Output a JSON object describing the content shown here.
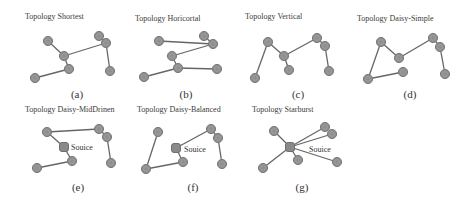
{
  "figure": {
    "node_color": "#8e8e8e",
    "edge_color": "#666666",
    "panels": [
      {
        "id": "a",
        "caption": "(a)",
        "title": "Topology Shortest",
        "title_pos": [
          25,
          19
        ],
        "caption_pos": [
          77,
          98
        ],
        "nodes": [
          [
            48,
            41
          ],
          [
            64,
            56
          ],
          [
            69,
            69
          ],
          [
            35,
            78
          ],
          [
            99,
            36
          ],
          [
            106,
            43
          ],
          [
            110,
            71
          ]
        ],
        "edges": [
          [
            0,
            1
          ],
          [
            1,
            2
          ],
          [
            2,
            3
          ],
          [
            1,
            5
          ],
          [
            4,
            5
          ],
          [
            5,
            6
          ]
        ],
        "source": null
      },
      {
        "id": "b",
        "caption": "(b)",
        "title": "Topology Horicortal",
        "title_pos": [
          135,
          21
        ],
        "caption_pos": [
          186,
          98
        ],
        "nodes": [
          [
            159,
            41
          ],
          [
            204,
            36
          ],
          [
            213,
            44
          ],
          [
            172,
            56
          ],
          [
            178,
            68
          ],
          [
            217,
            69
          ],
          [
            144,
            77
          ]
        ],
        "edges": [
          [
            0,
            2
          ],
          [
            1,
            2
          ],
          [
            2,
            3
          ],
          [
            3,
            4
          ],
          [
            4,
            5
          ],
          [
            4,
            6
          ]
        ],
        "source": null
      },
      {
        "id": "c",
        "caption": "(c)",
        "title": "Topology Vertical",
        "title_pos": [
          245,
          19
        ],
        "caption_pos": [
          298,
          98
        ],
        "nodes": [
          [
            268,
            42
          ],
          [
            284,
            56
          ],
          [
            289,
            70
          ],
          [
            255,
            78
          ],
          [
            317,
            38
          ],
          [
            325,
            46
          ],
          [
            329,
            71
          ]
        ],
        "edges": [
          [
            0,
            1
          ],
          [
            1,
            2
          ],
          [
            0,
            3
          ],
          [
            1,
            4
          ],
          [
            4,
            5
          ],
          [
            5,
            6
          ]
        ],
        "source": null
      },
      {
        "id": "d",
        "caption": "(d)",
        "title": "Topology Daisy-Simple",
        "title_pos": [
          357,
          21
        ],
        "caption_pos": [
          410,
          98
        ],
        "nodes": [
          [
            381,
            42
          ],
          [
            399,
            58
          ],
          [
            403,
            72
          ],
          [
            368,
            79
          ],
          [
            433,
            38
          ],
          [
            440,
            47
          ],
          [
            445,
            74
          ]
        ],
        "edges": [
          [
            0,
            1
          ],
          [
            1,
            4
          ],
          [
            4,
            5
          ],
          [
            5,
            6
          ],
          [
            0,
            3
          ],
          [
            3,
            2
          ]
        ],
        "source": null
      },
      {
        "id": "e",
        "caption": "(e)",
        "title": "Topology Daisy-MidDrinen",
        "title_pos": [
          25,
          112
        ],
        "caption_pos": [
          78,
          191
        ],
        "nodes": [
          [
            47,
            132
          ],
          [
            64,
            147
          ],
          [
            72,
            161
          ],
          [
            37,
            168
          ],
          [
            99,
            129
          ],
          [
            107,
            137
          ],
          [
            111,
            163
          ]
        ],
        "edges": [
          [
            0,
            4
          ],
          [
            0,
            1
          ],
          [
            1,
            2
          ],
          [
            2,
            3
          ],
          [
            4,
            5
          ],
          [
            5,
            6
          ]
        ],
        "source": {
          "index": 1,
          "label": "Souice",
          "label_pos": [
            71,
            150
          ]
        }
      },
      {
        "id": "f",
        "caption": "(f)",
        "title": "Topology Daisy-Balanced",
        "title_pos": [
          137,
          112
        ],
        "caption_pos": [
          193,
          191
        ],
        "nodes": [
          [
            158,
            132
          ],
          [
            176,
            148
          ],
          [
            183,
            162
          ],
          [
            146,
            169
          ],
          [
            211,
            129
          ],
          [
            218,
            138
          ],
          [
            222,
            164
          ]
        ],
        "edges": [
          [
            0,
            3
          ],
          [
            3,
            2
          ],
          [
            2,
            1
          ],
          [
            1,
            4
          ],
          [
            4,
            5
          ],
          [
            5,
            6
          ]
        ],
        "source": {
          "index": 1,
          "label": "Souice",
          "label_pos": [
            184,
            152
          ]
        }
      },
      {
        "id": "g",
        "caption": "(g)",
        "title": "Topology Starburst",
        "title_pos": [
          252,
          112
        ],
        "caption_pos": [
          302,
          191
        ],
        "nodes": [
          [
            274,
            131
          ],
          [
            290,
            147
          ],
          [
            298,
            160
          ],
          [
            263,
            168
          ],
          [
            325,
            127
          ],
          [
            332,
            134
          ],
          [
            337,
            162
          ]
        ],
        "edges": [
          [
            1,
            0
          ],
          [
            1,
            2
          ],
          [
            1,
            3
          ],
          [
            1,
            4
          ],
          [
            1,
            5
          ],
          [
            1,
            6
          ]
        ],
        "source": {
          "index": 1,
          "label": "Souice",
          "label_pos": [
            309,
            152
          ]
        }
      }
    ]
  }
}
